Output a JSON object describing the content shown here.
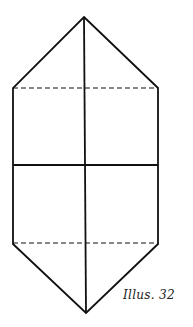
{
  "diagram": {
    "caption": "Illus. 32",
    "stroke_color": "#111111",
    "shape": "elongated hexagon with vertical center line, horizontal center line, and two dashed fold lines"
  }
}
